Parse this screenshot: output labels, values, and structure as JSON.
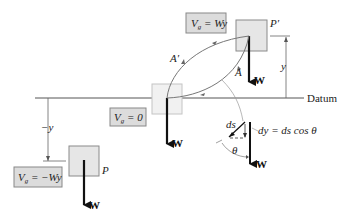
{
  "diagram": {
    "datum_label": "Datum",
    "top": {
      "position_label": "P′",
      "energy_label": "V_g = Wy",
      "energy_main": "V",
      "energy_sub": "g",
      "energy_rest": " = Wy",
      "height_label": "y",
      "weight_label": "W"
    },
    "middle": {
      "energy_main": "V",
      "energy_sub": "g",
      "energy_rest": " = 0",
      "weight_label": "W"
    },
    "bottom": {
      "position_label": "P",
      "energy_main": "V",
      "energy_sub": "g",
      "energy_rest": " = −Wy",
      "height_label": "−y",
      "weight_label": "W"
    },
    "paths": {
      "path_a": "A",
      "path_a_prime": "A′"
    },
    "detail": {
      "ds_label": "ds",
      "theta_label": "θ",
      "dy_equation": "dy = ds cos θ",
      "weight_label": "W"
    },
    "colors": {
      "box_fill": "#e6e6e6",
      "box_stroke": "#8a8a8a",
      "label_box_fill": "#dcdcdc",
      "line": "#333333",
      "path": "#777777"
    }
  }
}
